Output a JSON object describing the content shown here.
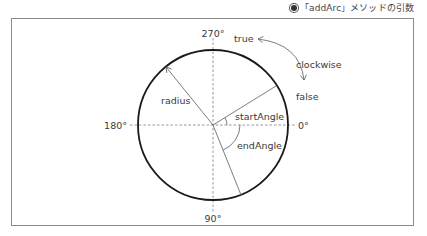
{
  "caption": {
    "bullet": "●",
    "text": "「addArc」メソッドの引数"
  },
  "diagram": {
    "center": [
      213,
      125
    ],
    "radius": 76,
    "axis_labels": {
      "deg_270": "270°",
      "deg_180": "180°",
      "deg_0": "0°",
      "deg_90": "90°"
    },
    "radius_label": "radius",
    "start_angle_label": "startAngle",
    "end_angle_label": "endAngle",
    "start_angle_deg": -32,
    "end_angle_deg": 68,
    "clockwise": {
      "label": "clockwise",
      "true_label": "true",
      "false_label": "false"
    },
    "colors": {
      "circle": "#1a1a1a",
      "lines": "#6e6e6e",
      "dashed": "#8a8a8a",
      "text": "#3a3a3a",
      "frame": "#8a8a8a"
    }
  }
}
